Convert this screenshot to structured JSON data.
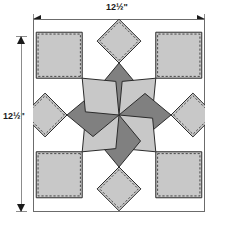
{
  "diagram": {
    "type": "quilt-block-diagram",
    "dimensions": {
      "top_label": "12½\"",
      "left_label": "12½\"",
      "width_value": "12½",
      "height_value": "12½",
      "unit": "inch"
    },
    "colors": {
      "light_gray": "#c8c8c8",
      "dark_gray": "#808080",
      "white": "#ffffff",
      "outline": "#2b2b2b",
      "frame": "#6b6b6b",
      "dimension_line": "#8c8c8c",
      "arrow": "#1a1a1a",
      "seam_dash": "#3a3a3a"
    },
    "pieces": {
      "star_points": 8,
      "dark_diamonds": 4,
      "light_diamonds": 4,
      "corner_squares": 4,
      "on_point_squares": 4
    },
    "geometry": {
      "frame_size": 172,
      "frame_height": 193,
      "center_x": 86,
      "center_y": 96,
      "diamond_reach": 52,
      "square_side": 46,
      "onpoint_half": 31
    },
    "icons": {
      "arrow_left": "arrow-left-icon",
      "arrow_right": "arrow-right-icon",
      "arrow_up": "arrow-up-icon",
      "arrow_down": "arrow-down-icon"
    }
  }
}
